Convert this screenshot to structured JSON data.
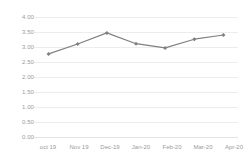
{
  "chart_data": {
    "type": "line",
    "title": "",
    "subtitle": "",
    "xlabel": "",
    "ylabel": "",
    "categories": [
      "oct 19",
      "Nov 19",
      "Dec-19",
      "Jan-20",
      "Feb-20",
      "Mar-20",
      "Apr-20"
    ],
    "values": [
      2.77,
      3.1,
      3.47,
      3.11,
      2.97,
      3.26,
      3.4
    ],
    "series": [
      {
        "name": "",
        "values": [
          2.77,
          3.1,
          3.47,
          3.11,
          2.97,
          3.26,
          3.4
        ]
      }
    ],
    "ylim": [
      0.0,
      4.0
    ],
    "ytick_step": 0.5,
    "ytick_labels": [
      "4.00",
      "3.50",
      "3.00",
      "2.50",
      "2.00",
      "1.50",
      "1.00",
      "0.50",
      "0.00"
    ],
    "ytick_values": [
      4.0,
      3.5,
      3.0,
      2.5,
      2.0,
      1.5,
      1.0,
      0.5,
      0.0
    ],
    "grid": true,
    "grid_axis": "y",
    "legend": false,
    "legend_position": "none",
    "annotations": [],
    "colors": {
      "line": "#808080",
      "marker": "#7f7f7f",
      "grid": "#ededed",
      "baseline": "#e2e2e2",
      "tick_text": "#9a9a9a",
      "background": "#ffffff"
    },
    "marker_shape": "diamond",
    "line_width": 1.2
  }
}
